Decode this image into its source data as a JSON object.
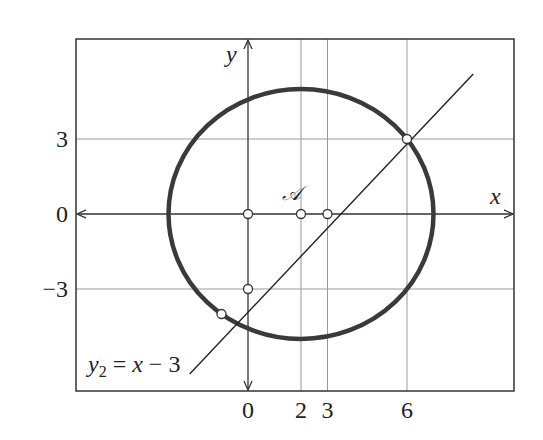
{
  "figure": {
    "frame": {
      "left": 76,
      "top": 39,
      "right": 514,
      "bottom": 391
    },
    "origin_px": {
      "x": 248,
      "y": 214
    },
    "unit_px": {
      "x": 26.5,
      "y": 25
    },
    "axes": {
      "x_label": "x",
      "y_label": "y",
      "x_ticks": [
        {
          "value": 0,
          "label": "0"
        },
        {
          "value": 2,
          "label": "2"
        },
        {
          "value": 3,
          "label": "3"
        },
        {
          "value": 6,
          "label": "6"
        }
      ],
      "y_ticks": [
        {
          "value": 3,
          "label": "3"
        },
        {
          "value": 0,
          "label": "0"
        },
        {
          "value": -3,
          "label": "−3"
        }
      ]
    },
    "grid": {
      "vertical_x": [
        2,
        3,
        6
      ],
      "horizontal_y": [
        3,
        -3
      ]
    },
    "circle": {
      "center": [
        2,
        0
      ],
      "radius": 5,
      "center_label": "𝒜",
      "stroke": "#3a3a3a"
    },
    "line": {
      "label_y": "y",
      "label_sub": "2",
      "label_eq": " = ",
      "label_x": "x",
      "label_rest": " − 3",
      "from": [
        -2.2,
        -6.4
      ],
      "to": [
        8.5,
        5.6
      ]
    },
    "points": [
      {
        "name": "origin",
        "x": 0,
        "y": 0
      },
      {
        "name": "circle-center",
        "x": 2,
        "y": 0
      },
      {
        "name": "x-intercept",
        "x": 3,
        "y": 0
      },
      {
        "name": "y-intercept",
        "x": 0,
        "y": -3
      },
      {
        "name": "intersection-upper",
        "x": 6,
        "y": 3
      },
      {
        "name": "intersection-lower",
        "x": -1,
        "y": -4
      }
    ],
    "colors": {
      "frame": "#333333",
      "grid": "#9a9a9a",
      "axis": "#333333",
      "circle": "#3a3a3a",
      "line": "#222222",
      "point_fill": "#ffffff"
    }
  }
}
